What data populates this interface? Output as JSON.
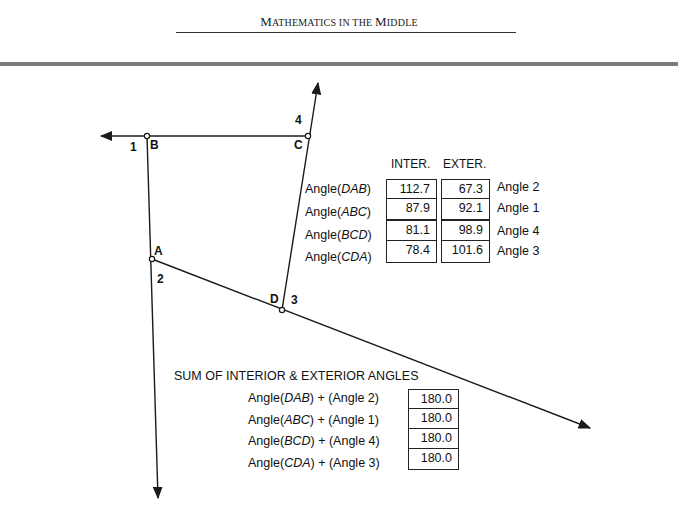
{
  "header": {
    "title_parts": [
      {
        "big": "M",
        "small": "ATHEMATICS IN THE "
      },
      {
        "big": "M",
        "small": "IDDLE"
      }
    ],
    "title": "Mathematics in the Middle"
  },
  "diagram": {
    "points": {
      "A": {
        "label": "A",
        "x": 152,
        "y": 259
      },
      "B": {
        "label": "B",
        "x": 147,
        "y": 136
      },
      "C": {
        "label": "C",
        "x": 308,
        "y": 136
      },
      "D": {
        "label": "D",
        "x": 282,
        "y": 310
      }
    },
    "exterior_angle_labels": {
      "angle1": "1",
      "angle2": "2",
      "angle3": "3",
      "angle4": "4"
    },
    "line_color": "#1a1a1a"
  },
  "angle_table": {
    "col_interior": "INTER.",
    "col_exterior": "EXTER.",
    "rows": [
      {
        "prefix": "Angle(",
        "name": "DAB",
        "suffix": ")",
        "interior": "112.7",
        "exterior": "67.3",
        "ext_label": "Angle 2"
      },
      {
        "prefix": "Angle(",
        "name": "ABC",
        "suffix": ")",
        "interior": "87.9",
        "exterior": "92.1",
        "ext_label": "Angle 1"
      },
      {
        "prefix": "Angle(",
        "name": "BCD",
        "suffix": ")",
        "interior": "81.1",
        "exterior": "98.9",
        "ext_label": "Angle 4"
      },
      {
        "prefix": "Angle(",
        "name": "CDA",
        "suffix": ")",
        "interior": "78.4",
        "exterior": "101.6",
        "ext_label": "Angle 3"
      }
    ]
  },
  "sum_table": {
    "title": "SUM OF INTERIOR & EXTERIOR ANGLES",
    "rows": [
      {
        "prefix": "Angle(",
        "name": "DAB",
        "suffix": ") + (Angle 2)",
        "value": "180.0"
      },
      {
        "prefix": "Angle(",
        "name": "ABC",
        "suffix": ") + (Angle 1)",
        "value": "180.0"
      },
      {
        "prefix": "Angle(",
        "name": "BCD",
        "suffix": ") + (Angle 4)",
        "value": "180.0"
      },
      {
        "prefix": "Angle(",
        "name": "CDA",
        "suffix": ") + (Angle 3)",
        "value": "180.0"
      }
    ]
  }
}
